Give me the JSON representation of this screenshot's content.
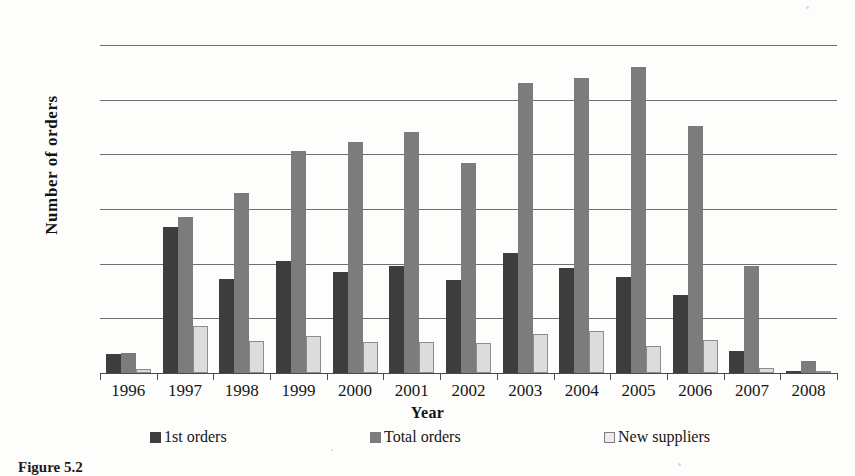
{
  "caption": "Figure 5.2",
  "chart_data": {
    "type": "bar",
    "title": "",
    "xlabel": "Year",
    "ylabel": "Number  of  orders",
    "ylim": [
      0,
      300
    ],
    "yticks": [
      0,
      50,
      100,
      150,
      200,
      250,
      300
    ],
    "ytick_labels": [
      "0",
      "50",
      "100",
      "150",
      "200",
      "250",
      "300"
    ],
    "grid": true,
    "legend_position": "bottom",
    "categories": [
      "1996",
      "1997",
      "1998",
      "1999",
      "2000",
      "2001",
      "2002",
      "2003",
      "2004",
      "2005",
      "2006",
      "2007",
      "2008"
    ],
    "series": [
      {
        "name": "1st orders",
        "color": "#3d3d3d",
        "values": [
          17,
          134,
          86,
          102,
          92,
          98,
          85,
          110,
          96,
          88,
          71,
          20,
          2
        ]
      },
      {
        "name": "Total orders",
        "color": "#7c7c7c",
        "values": [
          18,
          143,
          165,
          203,
          211,
          220,
          192,
          265,
          270,
          280,
          226,
          98,
          11
        ]
      },
      {
        "name": "New suppliers",
        "color": "#dcdcdc",
        "values": [
          4,
          43,
          29,
          34,
          28,
          28,
          27,
          36,
          38,
          25,
          30,
          5,
          1
        ]
      }
    ]
  }
}
